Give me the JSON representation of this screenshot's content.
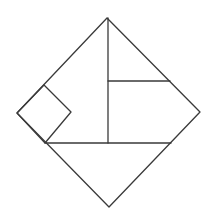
{
  "diagram": {
    "type": "geometric-dissection",
    "stroke_color": "#3a3a3a",
    "background": "#ffffff",
    "outer_diamond": {
      "top": [
        107,
        18
      ],
      "right": [
        200,
        112
      ],
      "bottom": [
        109,
        207
      ],
      "left": [
        17,
        113
      ]
    },
    "small_square": {
      "top": [
        44,
        85
      ],
      "right": [
        71,
        112
      ],
      "bottom": [
        45,
        143
      ],
      "left": [
        17,
        113
      ]
    },
    "segments": [
      {
        "name": "vertical-center-line",
        "from": [
          108,
          18
        ],
        "to": [
          108,
          143
        ]
      },
      {
        "name": "upper-horizontal-line",
        "from": [
          108,
          81
        ],
        "to": [
          170,
          81
        ]
      },
      {
        "name": "lower-horizontal-line",
        "from": [
          45,
          143
        ],
        "to": [
          171,
          143
        ]
      }
    ]
  }
}
